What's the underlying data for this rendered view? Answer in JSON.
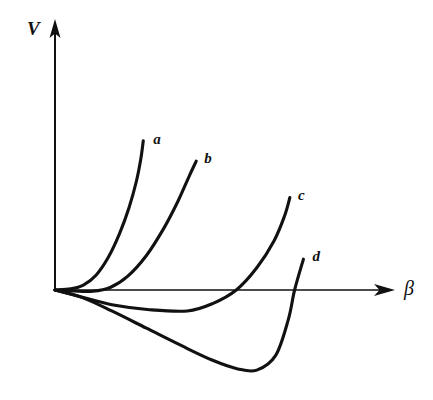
{
  "figure": {
    "kind": "line-plot",
    "background_color": "#ffffff",
    "ink_color": "#111111"
  },
  "axes": {
    "y": {
      "label": "V",
      "name": "potential-energy",
      "origin_px": [
        55,
        290
      ],
      "tip_px": [
        55,
        22
      ],
      "has_arrowhead": true,
      "has_ticks": false
    },
    "x": {
      "label": "β",
      "name": "deformation-parameter",
      "origin_px": [
        55,
        290
      ],
      "tip_px": [
        394,
        290
      ],
      "has_arrowhead": true,
      "has_ticks": false
    }
  },
  "curve_labels": [
    {
      "id": "a",
      "text": "a"
    },
    {
      "id": "b",
      "text": "b"
    },
    {
      "id": "c",
      "text": "c"
    },
    {
      "id": "d",
      "text": "d"
    }
  ],
  "chart_data": {
    "type": "line",
    "title": "",
    "subtitle": "",
    "xlabel": "β",
    "ylabel": "V",
    "grid": false,
    "legend": "inline-end-labels",
    "xlim": [
      0,
      1
    ],
    "ylim": [
      -0.33,
      1
    ],
    "axis_note": "Axes are unscaled/schematic: no tick marks, no numeric tick labels. Values below are normalized figure coordinates where x=0 is the origin and y=0 is the horizontal axis (V=0); positive y is up.",
    "series": [
      {
        "name": "a",
        "label": "a",
        "description": "Steeply rising, purely repulsive potential with minimum at the origin; no negative region.",
        "minimum": {
          "x": 0.0,
          "y": 0.0
        },
        "points": [
          {
            "x": 0.0,
            "y": 0.0
          },
          {
            "x": 0.05,
            "y": 0.005
          },
          {
            "x": 0.09,
            "y": 0.02
          },
          {
            "x": 0.13,
            "y": 0.06
          },
          {
            "x": 0.17,
            "y": 0.135
          },
          {
            "x": 0.205,
            "y": 0.23
          },
          {
            "x": 0.235,
            "y": 0.335
          },
          {
            "x": 0.258,
            "y": 0.44
          },
          {
            "x": 0.272,
            "y": 0.53
          },
          {
            "x": 0.28,
            "y": 0.605
          }
        ]
      },
      {
        "name": "b",
        "label": "b",
        "description": "Flat near the axis for small deformation, then rising steeply; minimum essentially at zero.",
        "minimum": {
          "x": 0.1,
          "y": -0.005
        },
        "points": [
          {
            "x": 0.0,
            "y": 0.0
          },
          {
            "x": 0.06,
            "y": -0.004
          },
          {
            "x": 0.12,
            "y": -0.005
          },
          {
            "x": 0.175,
            "y": 0.01
          },
          {
            "x": 0.23,
            "y": 0.055
          },
          {
            "x": 0.29,
            "y": 0.14
          },
          {
            "x": 0.345,
            "y": 0.25
          },
          {
            "x": 0.39,
            "y": 0.36
          },
          {
            "x": 0.425,
            "y": 0.46
          },
          {
            "x": 0.448,
            "y": 0.523
          }
        ]
      },
      {
        "name": "c",
        "label": "c",
        "description": "Shallow minimum below the axis, crossing back through V=0 and rising steeply.",
        "minimum": {
          "x": 0.42,
          "y": -0.085
        },
        "zero_crossing": {
          "x": 0.575,
          "y": 0.0
        },
        "points": [
          {
            "x": 0.0,
            "y": 0.0
          },
          {
            "x": 0.09,
            "y": -0.03
          },
          {
            "x": 0.19,
            "y": -0.062
          },
          {
            "x": 0.3,
            "y": -0.08
          },
          {
            "x": 0.42,
            "y": -0.085
          },
          {
            "x": 0.5,
            "y": -0.055
          },
          {
            "x": 0.575,
            "y": 0.0
          },
          {
            "x": 0.64,
            "y": 0.09
          },
          {
            "x": 0.695,
            "y": 0.2
          },
          {
            "x": 0.728,
            "y": 0.3
          },
          {
            "x": 0.745,
            "y": 0.375
          }
        ]
      },
      {
        "name": "d",
        "label": "d",
        "description": "Deep minimum well below the axis at large deformation; strongly deformed potential.",
        "minimum": {
          "x": 0.62,
          "y": -0.325
        },
        "zero_crossing": {
          "x": 0.76,
          "y": 0.0
        },
        "points": [
          {
            "x": 0.0,
            "y": 0.0
          },
          {
            "x": 0.085,
            "y": -0.03
          },
          {
            "x": 0.18,
            "y": -0.085
          },
          {
            "x": 0.29,
            "y": -0.155
          },
          {
            "x": 0.4,
            "y": -0.225
          },
          {
            "x": 0.5,
            "y": -0.285
          },
          {
            "x": 0.58,
            "y": -0.32
          },
          {
            "x": 0.64,
            "y": -0.325
          },
          {
            "x": 0.7,
            "y": -0.265
          },
          {
            "x": 0.74,
            "y": -0.12
          },
          {
            "x": 0.76,
            "y": 0.0
          },
          {
            "x": 0.788,
            "y": 0.125
          }
        ]
      }
    ]
  }
}
